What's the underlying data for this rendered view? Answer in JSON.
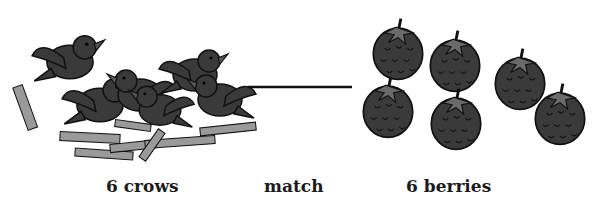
{
  "diagram": {
    "type": "one-to-one matching illustration",
    "left_group": {
      "count": 6,
      "item": "crows",
      "label": "6 crows"
    },
    "connector": {
      "label": "match"
    },
    "right_group": {
      "count": 6,
      "item": "berries",
      "label": "6 berries"
    }
  },
  "colors": {
    "fill_dark": "#3a3a3a",
    "twig_gray": "#9a9a9a",
    "outline": "#111111",
    "background": "#ffffff"
  }
}
